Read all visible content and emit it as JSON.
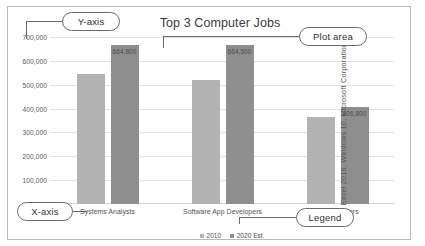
{
  "figure": {
    "credit": "Excel 2016, Windows 10, Microsoft Corporation"
  },
  "callouts": {
    "y_axis": "Y-axis",
    "plot_area": "Plot area",
    "x_axis": "X-axis",
    "legend": "Legend"
  },
  "chart_data": {
    "type": "bar",
    "title": "Top 3 Computer Jobs",
    "xlabel": "",
    "ylabel": "",
    "ylim": [
      0,
      700000
    ],
    "grid": true,
    "legend_position": "bottom",
    "categories": [
      "Systems Analysts",
      "Software App Developers",
      "Programmers"
    ],
    "ytick_labels": [
      "100,000",
      "200,000",
      "300,000",
      "400,000",
      "500,000",
      "600,000",
      "700,000"
    ],
    "ytick_values": [
      100000,
      200000,
      300000,
      400000,
      500000,
      600000,
      700000
    ],
    "series": [
      {
        "name": "2010",
        "color": "#b3b3b3",
        "values": [
          544400,
          520800,
          363100
        ],
        "labels": [
          "",
          "",
          ""
        ]
      },
      {
        "name": "2020 Est.",
        "color": "#8e8e8e",
        "values": [
          664800,
          664500,
          406800
        ],
        "labels": [
          "664,800",
          "664,500",
          "406,800"
        ]
      }
    ]
  }
}
